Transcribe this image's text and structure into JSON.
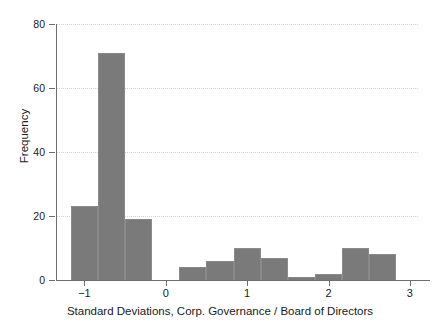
{
  "chart_data": {
    "type": "bar",
    "title": "",
    "subtitle": "",
    "xlabel": "Standard Deviations, Corp. Governance / Board of Directors",
    "ylabel": "Frequency",
    "xlim": [
      -1.35,
      3.1
    ],
    "ylim": [
      0,
      80
    ],
    "grid": true,
    "legend": null,
    "bar_color": "#7a7a7a",
    "bar_edge_color": "#8a8a8a",
    "background_color": "#ffffff",
    "axis_color": "#6e6e6e",
    "gridline_color": "#d2d2d2",
    "bin_width": 0.3333,
    "x_ticks": [
      {
        "value": -1,
        "label": "−1"
      },
      {
        "value": 0,
        "label": "0"
      },
      {
        "value": 1,
        "label": "1"
      },
      {
        "value": 2,
        "label": "2"
      },
      {
        "value": 3,
        "label": "3"
      }
    ],
    "y_ticks": [
      {
        "value": 0,
        "label": "0"
      },
      {
        "value": 20,
        "label": "20"
      },
      {
        "value": 40,
        "label": "40"
      },
      {
        "value": 60,
        "label": "60"
      },
      {
        "value": 80,
        "label": "80"
      }
    ],
    "bins": [
      {
        "x0": -1.167,
        "x1": -0.833,
        "value": 23
      },
      {
        "x0": -0.833,
        "x1": -0.5,
        "value": 71
      },
      {
        "x0": -0.5,
        "x1": -0.167,
        "value": 19
      },
      {
        "x0": -0.167,
        "x1": 0.167,
        "value": 0
      },
      {
        "x0": 0.167,
        "x1": 0.5,
        "value": 4
      },
      {
        "x0": 0.5,
        "x1": 0.833,
        "value": 6
      },
      {
        "x0": 0.833,
        "x1": 1.167,
        "value": 10
      },
      {
        "x0": 1.167,
        "x1": 1.5,
        "value": 7
      },
      {
        "x0": 1.5,
        "x1": 1.833,
        "value": 1
      },
      {
        "x0": 1.833,
        "x1": 2.167,
        "value": 2
      },
      {
        "x0": 2.167,
        "x1": 2.5,
        "value": 10
      },
      {
        "x0": 2.5,
        "x1": 2.833,
        "value": 8
      }
    ],
    "categories": [
      "-1.17",
      "-0.83",
      "-0.50",
      "-0.17",
      "0.17",
      "0.50",
      "0.83",
      "1.17",
      "1.50",
      "1.83",
      "2.17",
      "2.50"
    ],
    "values": [
      23,
      71,
      19,
      0,
      4,
      6,
      10,
      7,
      1,
      2,
      10,
      8
    ]
  }
}
